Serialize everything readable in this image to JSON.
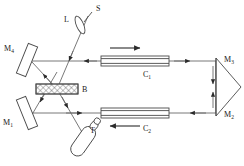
{
  "figure": {
    "background_color": "#ffffff",
    "line_color": "#4a4a4a",
    "beam_color": "#6a6a6a",
    "label_color": "#1a1a1a",
    "width": 244,
    "height": 166
  },
  "labels": {
    "source": "S",
    "lens": "L",
    "beamsplitter": "B",
    "detector": "T",
    "mirror1": "M",
    "mirror1_sub": "1",
    "mirror2": "M",
    "mirror2_sub": "2",
    "mirror3": "M",
    "mirror3_sub": "3",
    "mirror4": "M",
    "mirror4_sub": "4",
    "cell1": "C",
    "cell1_sub": "1",
    "cell2": "C",
    "cell2_sub": "2"
  },
  "components": [
    {
      "name": "source-S",
      "label": "S",
      "kind": "light-source"
    },
    {
      "name": "lens-L",
      "label": "L",
      "kind": "lens"
    },
    {
      "name": "beamsplitter-B",
      "label": "B",
      "kind": "beam-splitter"
    },
    {
      "name": "detector-T",
      "label": "T",
      "kind": "detector"
    },
    {
      "name": "mirror-M1",
      "label": "M1",
      "kind": "plane-mirror"
    },
    {
      "name": "mirror-M2",
      "label": "M2",
      "kind": "prism-mirror"
    },
    {
      "name": "mirror-M3",
      "label": "M3",
      "kind": "prism-mirror"
    },
    {
      "name": "mirror-M4",
      "label": "M4",
      "kind": "plane-mirror"
    },
    {
      "name": "cell-C1",
      "label": "C1",
      "kind": "sample-cell"
    },
    {
      "name": "cell-C2",
      "label": "C2",
      "kind": "sample-cell"
    }
  ],
  "flow_arrows": [
    {
      "name": "arrow-upper-cell-direction",
      "direction": "right",
      "near": "C1"
    },
    {
      "name": "arrow-lower-cell-direction",
      "direction": "left",
      "near": "C2"
    },
    {
      "name": "arrow-source-to-beamsplitter",
      "direction": "down-left"
    },
    {
      "name": "arrow-upper-beam-to-splitter",
      "direction": "left"
    },
    {
      "name": "arrow-upper-beam-to-prism",
      "direction": "right"
    },
    {
      "name": "arrow-lower-beam-to-prism",
      "direction": "right"
    },
    {
      "name": "arrow-lower-beam-to-splitter",
      "direction": "left"
    },
    {
      "name": "arrow-prism-down",
      "direction": "down"
    },
    {
      "name": "arrow-prism-up",
      "direction": "up"
    },
    {
      "name": "arrow-to-mirror-M4",
      "direction": "up-left"
    },
    {
      "name": "arrow-to-mirror-M1",
      "direction": "down-left"
    },
    {
      "name": "arrow-to-detector-T",
      "direction": "down-right"
    }
  ]
}
